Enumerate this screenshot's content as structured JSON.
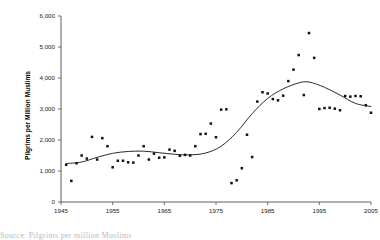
{
  "figure": {
    "background": "#ffffff",
    "caption_sliver": "Source: Pilgrims per million Muslims"
  },
  "chart_data": {
    "type": "scatter",
    "title": "",
    "xlabel": "",
    "ylabel": "Pilgrims per Million Muslims",
    "xlim": [
      1945,
      2005
    ],
    "ylim": [
      0,
      6000
    ],
    "grid": false,
    "legend": null,
    "xticks": [
      1945,
      1955,
      1965,
      1975,
      1985,
      1995,
      2005
    ],
    "xtick_labels": [
      "1945",
      "1955",
      "1965",
      "1975",
      "1985",
      "1995",
      "2005"
    ],
    "yticks": [
      0,
      1000,
      2000,
      3000,
      4000,
      5000,
      6000
    ],
    "ytick_labels": [
      "0",
      "1,000",
      "2,000",
      "3,000",
      "4,000",
      "5,000",
      "6,000"
    ],
    "point_color": "#111111",
    "curve_color": "#2b2b2b",
    "series": [
      {
        "name": "Pilgrims per million Muslims",
        "type": "scatter",
        "x": [
          1946,
          1947,
          1948,
          1949,
          1950,
          1951,
          1952,
          1953,
          1954,
          1955,
          1956,
          1957,
          1958,
          1959,
          1960,
          1961,
          1962,
          1963,
          1964,
          1965,
          1966,
          1967,
          1968,
          1969,
          1970,
          1971,
          1972,
          1973,
          1974,
          1975,
          1976,
          1977,
          1978,
          1979,
          1980,
          1981,
          1982,
          1983,
          1984,
          1985,
          1986,
          1987,
          1988,
          1989,
          1990,
          1991,
          1992,
          1993,
          1994,
          1995,
          1996,
          1997,
          1998,
          1999,
          2000,
          2001,
          2002,
          2003,
          2004,
          2005
        ],
        "y": [
          1200,
          680,
          1250,
          1500,
          1400,
          2100,
          1370,
          2060,
          1800,
          1120,
          1330,
          1330,
          1280,
          1270,
          1500,
          1800,
          1370,
          1560,
          1430,
          1440,
          1690,
          1650,
          1490,
          1520,
          1500,
          1800,
          2190,
          2200,
          2530,
          2090,
          2980,
          2990,
          610,
          700,
          1090,
          2170,
          1450,
          3240,
          3540,
          3500,
          3320,
          3280,
          3430,
          3900,
          4270,
          4740,
          3450,
          5450,
          4650,
          3000,
          3030,
          3040,
          3010,
          2960,
          3420,
          3400,
          3420,
          3410,
          3120,
          2880
        ]
      },
      {
        "name": "Smoothed trend",
        "type": "line",
        "x": [
          1946,
          1949,
          1952,
          1955,
          1958,
          1961,
          1964,
          1967,
          1970,
          1973,
          1976,
          1979,
          1982,
          1985,
          1988,
          1991,
          1993,
          1996,
          1999,
          2002,
          2005
        ],
        "y": [
          1240,
          1290,
          1440,
          1570,
          1630,
          1640,
          1590,
          1540,
          1520,
          1580,
          1800,
          2250,
          2850,
          3340,
          3650,
          3840,
          3870,
          3700,
          3450,
          3180,
          3080
        ]
      }
    ]
  }
}
